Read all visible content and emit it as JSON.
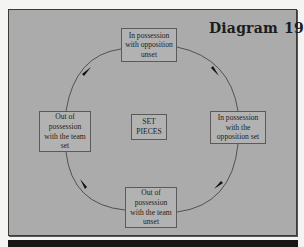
{
  "diagram": {
    "title": "Diagram",
    "number": "19",
    "center_label": "SET PIECES",
    "flow_direction": "clockwise",
    "nodes": [
      {
        "position": "top",
        "label": "In possession with opposition unset"
      },
      {
        "position": "right",
        "label": "In possession with the opposition set"
      },
      {
        "position": "bottom",
        "label": "Out of possession with the team unset"
      },
      {
        "position": "left",
        "label": "Out of possession with the team set"
      }
    ],
    "colors": {
      "panel_fill": "#ababab",
      "box_fill": "#b2b2b2",
      "line": "#3a3a3a",
      "text": "#1e1e1e"
    }
  }
}
